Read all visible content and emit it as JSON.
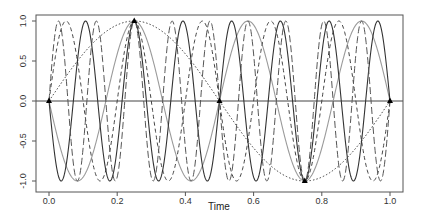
{
  "chart_data": {
    "type": "line",
    "title": "",
    "xlabel": "Time",
    "ylabel": "",
    "xlim": [
      0.0,
      1.0
    ],
    "ylim": [
      -1.0,
      1.0
    ],
    "x_ticks": [
      "0.0",
      "0.2",
      "0.4",
      "0.6",
      "0.8",
      "1.0"
    ],
    "y_ticks": [
      "-1.0",
      "-0.5",
      "0.0",
      "0.5",
      "1.0"
    ],
    "grid": false,
    "legend": "none",
    "series": [
      {
        "name": "f=1",
        "frequency": 1,
        "style": "dotted",
        "color": "#333333"
      },
      {
        "name": "f=-3",
        "frequency": -3,
        "style": "solid",
        "color": "#9a9a9a"
      },
      {
        "name": "f=5",
        "frequency": 5,
        "style": "dashed",
        "color": "#444444"
      },
      {
        "name": "f=-7",
        "frequency": -7,
        "style": "solid",
        "color": "#333333"
      },
      {
        "name": "f=9",
        "frequency": 9,
        "style": "longdash",
        "color": "#555555"
      }
    ],
    "sample_points": {
      "x": [
        0.0,
        0.25,
        0.5,
        0.75,
        1.0
      ],
      "y": [
        0.0,
        1.0,
        0.0,
        -1.0,
        0.0
      ]
    },
    "reference_line": {
      "y": 0.0
    }
  }
}
